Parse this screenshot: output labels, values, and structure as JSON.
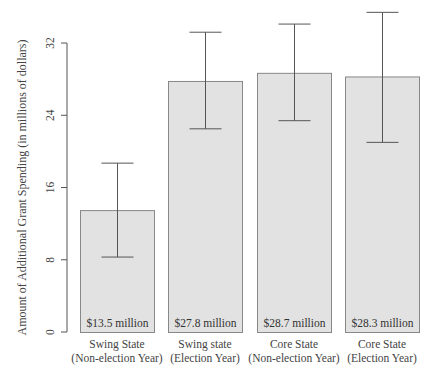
{
  "chart_data": {
    "type": "bar",
    "title": "",
    "xlabel": "",
    "ylabel": "Amount of Additional Grant Spending (in millions of dollars)",
    "ylim": [
      0,
      32
    ],
    "yticks": [
      0,
      8,
      16,
      24,
      32
    ],
    "grid": false,
    "legend": null,
    "categories": [
      [
        "Swing State",
        "(Non-election Year)"
      ],
      [
        "Swing state",
        "(Election Year)"
      ],
      [
        "Core State",
        "(Non-election Year)"
      ],
      [
        "Core State",
        "(Election Year)"
      ]
    ],
    "values": [
      13.5,
      27.8,
      28.7,
      28.3
    ],
    "bar_labels": [
      "$13.5 million",
      "$27.8 million",
      "$28.7 million",
      "$28.3 million"
    ],
    "error_bars": {
      "lower": [
        8.3,
        22.5,
        23.4,
        21.0
      ],
      "upper": [
        18.7,
        33.2,
        34.1,
        35.4
      ]
    },
    "colors": {
      "bar_fill": "#e2e2e2",
      "bar_border": "#888888",
      "error_bar": "#555555",
      "axis": "#555555"
    }
  }
}
